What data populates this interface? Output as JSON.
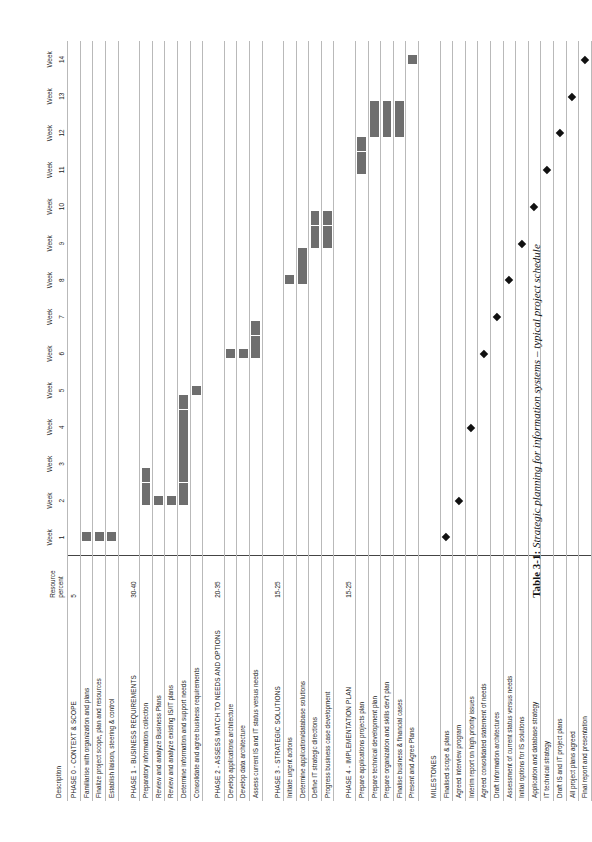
{
  "caption": {
    "label": "Table 3-1:",
    "text": "Strategic planning for information systems – typical project schedule"
  },
  "header": {
    "description": "Description",
    "resource": "Resource percent",
    "weeks": [
      "Week 1",
      "Week 2",
      "Week 3",
      "Week 4",
      "Week 5",
      "Week 6",
      "Week 7",
      "Week 8",
      "Week 9",
      "Week 10",
      "Week 11",
      "Week 12",
      "Week 13",
      "Week 14"
    ]
  },
  "chart_data": {
    "type": "bar",
    "title": "Strategic planning for information systems – typical project schedule",
    "xlabel": "",
    "ylabel": "",
    "categories": [
      "Week 1",
      "Week 2",
      "Week 3",
      "Week 4",
      "Week 5",
      "Week 6",
      "Week 7",
      "Week 8",
      "Week 9",
      "Week 10",
      "Week 11",
      "Week 12",
      "Week 13",
      "Week 14"
    ],
    "xlim": [
      1,
      14
    ],
    "grid": true,
    "legend": "none",
    "rows": [
      {
        "kind": "phase",
        "desc": "PHASE 0 - CONTEXT & SCOPE",
        "resource": "5",
        "bars": []
      },
      {
        "kind": "task",
        "desc": "Familiarise with organization and plans",
        "resource": "",
        "bars": [
          {
            "start": 1,
            "end": 1
          }
        ]
      },
      {
        "kind": "task",
        "desc": "Finalize project scope, plan and resources",
        "resource": "",
        "bars": [
          {
            "start": 1,
            "end": 1
          }
        ]
      },
      {
        "kind": "task",
        "desc": "Establish liaison, steering & control",
        "resource": "",
        "bars": [
          {
            "start": 1,
            "end": 1
          }
        ]
      },
      {
        "kind": "spacer",
        "desc": "",
        "resource": "",
        "bars": []
      },
      {
        "kind": "phase",
        "desc": "PHASE 1 - BUSINESS REQUIREMENTS",
        "resource": "30-40",
        "bars": []
      },
      {
        "kind": "task",
        "desc": "Preparatory information collection",
        "resource": "",
        "bars": [
          {
            "start": 2,
            "end": 3
          }
        ]
      },
      {
        "kind": "task",
        "desc": "Review and analyze Business Plans",
        "resource": "",
        "bars": [
          {
            "start": 2,
            "end": 2
          }
        ]
      },
      {
        "kind": "task",
        "desc": "Review and analyze existing IS/IT plans",
        "resource": "",
        "bars": [
          {
            "start": 2,
            "end": 2
          }
        ]
      },
      {
        "kind": "task",
        "desc": "Determine information and support needs",
        "resource": "",
        "bars": [
          {
            "start": 2,
            "end": 5
          }
        ]
      },
      {
        "kind": "task",
        "desc": "Consolidate and agree business requirements",
        "resource": "",
        "bars": [
          {
            "start": 5,
            "end": 5
          }
        ]
      },
      {
        "kind": "spacer",
        "desc": "",
        "resource": "",
        "bars": []
      },
      {
        "kind": "phase",
        "desc": "PHASE 2 - ASSESS MATCH TO NEEDS AND OPTIONS",
        "resource": "20-35",
        "bars": []
      },
      {
        "kind": "task",
        "desc": "Develop applications architecture",
        "resource": "",
        "bars": [
          {
            "start": 6,
            "end": 6
          }
        ]
      },
      {
        "kind": "task",
        "desc": "Develop data architecture",
        "resource": "",
        "bars": [
          {
            "start": 6,
            "end": 6
          }
        ]
      },
      {
        "kind": "task",
        "desc": "Assess current IS and IT status versus needs",
        "resource": "",
        "bars": [
          {
            "start": 6,
            "end": 7
          }
        ]
      },
      {
        "kind": "spacer",
        "desc": "",
        "resource": "",
        "bars": []
      },
      {
        "kind": "phase",
        "desc": "PHASE 3 - STRATEGIC SOLUTIONS",
        "resource": "15-25",
        "bars": []
      },
      {
        "kind": "task",
        "desc": "Initiate urgent actions",
        "resource": "",
        "bars": [
          {
            "start": 8,
            "end": 8
          }
        ]
      },
      {
        "kind": "task",
        "desc": "Determine application/database solutions",
        "resource": "",
        "bars": [
          {
            "start": 8,
            "end": 9
          }
        ]
      },
      {
        "kind": "task",
        "desc": "Define IT strategic directions",
        "resource": "",
        "bars": [
          {
            "start": 9,
            "end": 10
          }
        ]
      },
      {
        "kind": "task",
        "desc": "Progress business case development",
        "resource": "",
        "bars": [
          {
            "start": 9,
            "end": 10
          }
        ]
      },
      {
        "kind": "spacer",
        "desc": "",
        "resource": "",
        "bars": []
      },
      {
        "kind": "phase",
        "desc": "PHASE 4 - IMPLEMENTATION PLAN",
        "resource": "15-25",
        "bars": []
      },
      {
        "kind": "task",
        "desc": "Prepare applications projects plan",
        "resource": "",
        "bars": [
          {
            "start": 11,
            "end": 12
          }
        ]
      },
      {
        "kind": "task",
        "desc": "Prepare technical development plan",
        "resource": "",
        "bars": [
          {
            "start": 12,
            "end": 13
          }
        ]
      },
      {
        "kind": "task",
        "desc": "Prepare organization and skills dev't plan",
        "resource": "",
        "bars": [
          {
            "start": 12,
            "end": 13
          }
        ]
      },
      {
        "kind": "task",
        "desc": "Finalise business & financial cases",
        "resource": "",
        "bars": [
          {
            "start": 12,
            "end": 13
          }
        ]
      },
      {
        "kind": "task",
        "desc": "Present and Agree Plans",
        "resource": "",
        "bars": [
          {
            "start": 14,
            "end": 14
          }
        ]
      },
      {
        "kind": "spacer",
        "desc": "",
        "resource": "",
        "bars": []
      },
      {
        "kind": "section",
        "desc": "MILESTONES",
        "resource": "",
        "bars": []
      },
      {
        "kind": "milestone",
        "desc": "Finalised scope & plans",
        "resource": "",
        "milestone": 1
      },
      {
        "kind": "milestone",
        "desc": "Agreed interview program",
        "resource": "",
        "milestone": 2
      },
      {
        "kind": "milestone",
        "desc": "Interim report on high priority issues",
        "resource": "",
        "milestone": 4
      },
      {
        "kind": "milestone",
        "desc": "Agreed consolidated statement of needs",
        "resource": "",
        "milestone": 6
      },
      {
        "kind": "milestone",
        "desc": "Draft Information architectures",
        "resource": "",
        "milestone": 7
      },
      {
        "kind": "milestone",
        "desc": "Assessment of current status versus needs",
        "resource": "",
        "milestone": 8
      },
      {
        "kind": "milestone",
        "desc": "Initial options for IS solutions",
        "resource": "",
        "milestone": 9
      },
      {
        "kind": "milestone",
        "desc": "Application and database strategy",
        "resource": "",
        "milestone": 10
      },
      {
        "kind": "milestone",
        "desc": "IT technical strategy",
        "resource": "",
        "milestone": 11
      },
      {
        "kind": "milestone",
        "desc": "Draft IS and IT project plans",
        "resource": "",
        "milestone": 12
      },
      {
        "kind": "milestone",
        "desc": "All project plans agreed",
        "resource": "",
        "milestone": 13
      },
      {
        "kind": "milestone",
        "desc": "Final report and presentation",
        "resource": "",
        "milestone": 14
      }
    ]
  }
}
